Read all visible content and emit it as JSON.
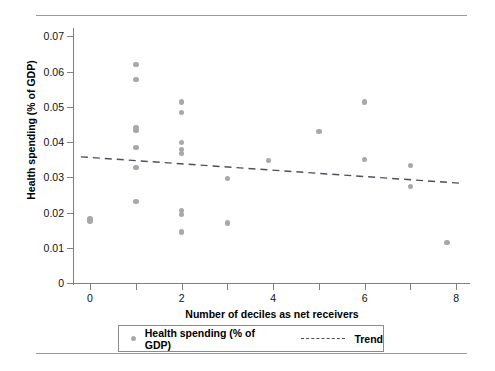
{
  "chart_data": {
    "type": "scatter",
    "title": "",
    "xlabel": "Number of deciles as net receivers",
    "ylabel": "Health spending (% of GDP)",
    "xlim": [
      -0.35,
      8.3
    ],
    "ylim": [
      0,
      0.0715
    ],
    "xticks": [
      0,
      1,
      2,
      3,
      4,
      5,
      6,
      7,
      8
    ],
    "xticklabels": [
      "0",
      "",
      "2",
      "",
      "4",
      "",
      "6",
      "",
      "8"
    ],
    "yticks": [
      0,
      0.01,
      0.02,
      0.03,
      0.04,
      0.05,
      0.06,
      0.07
    ],
    "yticklabels": [
      "0",
      "0.01",
      "0.02",
      "0.03",
      "0.04",
      "0.05",
      "0.06",
      "0.07"
    ],
    "grid": false,
    "legend_position": "below-axes",
    "marker_color": "#a8a8a8",
    "trend_color": "#4f4f5c",
    "series": [
      {
        "name": "Health spending (% of GDP)",
        "type": "scatter",
        "points": [
          {
            "x": 0.0,
            "y": 0.0182
          },
          {
            "x": 0.0,
            "y": 0.0176
          },
          {
            "x": 1.0,
            "y": 0.062
          },
          {
            "x": 1.0,
            "y": 0.0578
          },
          {
            "x": 1.0,
            "y": 0.0442
          },
          {
            "x": 1.0,
            "y": 0.0433
          },
          {
            "x": 1.0,
            "y": 0.0385
          },
          {
            "x": 1.0,
            "y": 0.0327
          },
          {
            "x": 1.0,
            "y": 0.0231
          },
          {
            "x": 2.0,
            "y": 0.0514
          },
          {
            "x": 2.0,
            "y": 0.0483
          },
          {
            "x": 2.0,
            "y": 0.0399
          },
          {
            "x": 2.0,
            "y": 0.0379
          },
          {
            "x": 2.0,
            "y": 0.0368
          },
          {
            "x": 2.0,
            "y": 0.0206
          },
          {
            "x": 2.0,
            "y": 0.0194
          },
          {
            "x": 2.0,
            "y": 0.0145
          },
          {
            "x": 3.0,
            "y": 0.0296
          },
          {
            "x": 3.0,
            "y": 0.017
          },
          {
            "x": 3.9,
            "y": 0.0348
          },
          {
            "x": 5.0,
            "y": 0.043
          },
          {
            "x": 6.0,
            "y": 0.0514
          },
          {
            "x": 6.0,
            "y": 0.035
          },
          {
            "x": 7.0,
            "y": 0.0334
          },
          {
            "x": 7.0,
            "y": 0.0274
          },
          {
            "x": 7.8,
            "y": 0.0115
          }
        ]
      },
      {
        "name": "Trend",
        "type": "line",
        "style": "dashed",
        "x": [
          -0.2,
          8.1
        ],
        "y": [
          0.0358,
          0.0283
        ]
      }
    ]
  },
  "legend": {
    "scatter_label": "Health spending (% of GDP)",
    "trend_label": "Trend"
  }
}
